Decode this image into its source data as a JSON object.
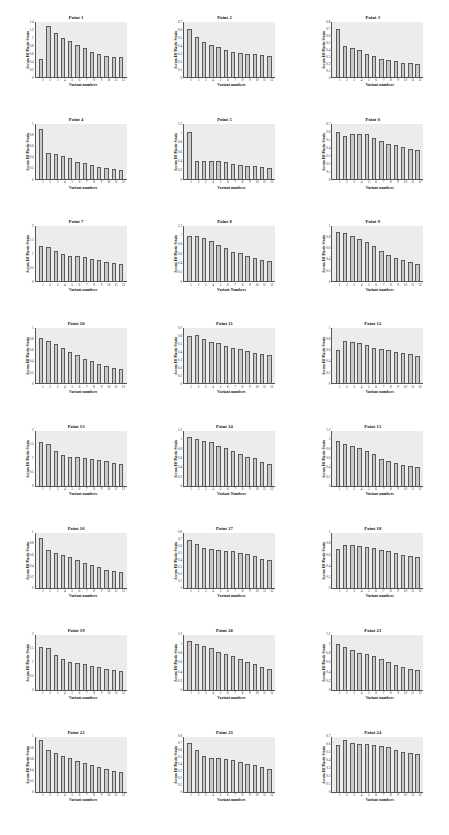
{
  "figure": {
    "layout": {
      "rows": 8,
      "cols": 3,
      "panels": 24
    },
    "shared": {
      "xlabel": "Variant numbers",
      "ylabel": "Accum Eff Plastic Strain",
      "categories": [
        "1",
        "2",
        "3",
        "4",
        "5",
        "6",
        "7",
        "8",
        "9",
        "10",
        "11",
        "12"
      ],
      "bar_fill": "#c9c9c9",
      "bar_edge": "#5a5a5a",
      "plot_background": "#ececec"
    }
  },
  "chart_data": [
    {
      "type": "bar",
      "title": "Point 1",
      "xlabel": "Variant numbers",
      "ylabel": "Accum Eff Plastic Strain",
      "categories": [
        "1",
        "2",
        "3",
        "4",
        "5",
        "6",
        "7",
        "8",
        "9",
        "10",
        "11",
        "12"
      ],
      "values": [
        0.45,
        1.3,
        1.12,
        1.0,
        0.92,
        0.82,
        0.73,
        0.63,
        0.58,
        0.55,
        0.52,
        0.5
      ],
      "ylim": [
        0,
        1.4
      ],
      "yticks": [
        "1.4",
        "1.2",
        "1",
        "0.8",
        "0.6",
        "0.4",
        "0.2",
        "0"
      ]
    },
    {
      "type": "bar",
      "title": "Point 2",
      "xlabel": "Variant numbers",
      "ylabel": "Accum Eff Plastic Strain",
      "categories": [
        "1",
        "2",
        "3",
        "4",
        "5",
        "6",
        "7",
        "8",
        "9",
        "10",
        "11",
        "12"
      ],
      "values": [
        0.61,
        0.51,
        0.45,
        0.41,
        0.38,
        0.35,
        0.32,
        0.31,
        0.3,
        0.29,
        0.285,
        0.27
      ],
      "ylim": [
        0,
        0.7
      ],
      "yticks": [
        "0.7",
        "0.6",
        "0.5",
        "0.4",
        "0.3",
        "0.2",
        "0.1",
        "0"
      ]
    },
    {
      "type": "bar",
      "title": "Point 3",
      "xlabel": "Variant numbers",
      "ylabel": "Accum Eff Plastic Strain",
      "categories": [
        "1",
        "2",
        "3",
        "4",
        "5",
        "6",
        "7",
        "8",
        "9",
        "10",
        "11",
        "12"
      ],
      "values": [
        0.7,
        0.45,
        0.42,
        0.39,
        0.34,
        0.31,
        0.27,
        0.25,
        0.23,
        0.21,
        0.2,
        0.19
      ],
      "ylim": [
        0,
        0.8
      ],
      "yticks": [
        "0.8",
        "0.7",
        "0.6",
        "0.5",
        "0.4",
        "0.3",
        "0.2",
        "0.1",
        "0"
      ]
    },
    {
      "type": "bar",
      "title": "Point 4",
      "xlabel": "Variant numbers",
      "ylabel": "Accum Eff Plastic Strain",
      "categories": [
        "1",
        "2",
        "3",
        "4",
        "5",
        "6",
        "7",
        "8",
        "9",
        "10",
        "11",
        "12"
      ],
      "values": [
        0.92,
        0.47,
        0.45,
        0.42,
        0.38,
        0.32,
        0.29,
        0.26,
        0.22,
        0.21,
        0.18,
        0.17
      ],
      "ylim": [
        0,
        1
      ],
      "yticks": [
        "1",
        "0.8",
        "0.6",
        "0.4",
        "0.2",
        "0"
      ]
    },
    {
      "type": "bar",
      "title": "Point 5",
      "xlabel": "Variant numbers",
      "ylabel": "Accum Eff Plastic Strain",
      "categories": [
        "1",
        "2",
        "3",
        "4",
        "5",
        "6",
        "7",
        "8",
        "9",
        "10",
        "11",
        "12"
      ],
      "values": [
        1.02,
        0.4,
        0.4,
        0.39,
        0.39,
        0.38,
        0.33,
        0.3,
        0.29,
        0.28,
        0.26,
        0.25
      ],
      "ylim": [
        0,
        1.2
      ],
      "yticks": [
        "1.2",
        "1",
        "0.8",
        "0.6",
        "0.4",
        "0.2",
        "0"
      ]
    },
    {
      "type": "bar",
      "title": "Point 6",
      "xlabel": "Variant numbers",
      "ylabel": "Accum Eff Plastic Strain",
      "categories": [
        "1",
        "2",
        "3",
        "4",
        "5",
        "6",
        "7",
        "8",
        "9",
        "10",
        "11",
        "12"
      ],
      "values": [
        0.6,
        0.55,
        0.58,
        0.58,
        0.57,
        0.53,
        0.49,
        0.45,
        0.43,
        0.41,
        0.39,
        0.37
      ],
      "ylim": [
        0,
        0.7
      ],
      "yticks": [
        "0.7",
        "0.6",
        "0.5",
        "0.4",
        "0.3",
        "0.2",
        "0.1",
        "0"
      ]
    },
    {
      "type": "bar",
      "title": "Point 7",
      "xlabel": "Variant numbers",
      "ylabel": "Accum Eff Plastic Strain",
      "categories": [
        "1",
        "2",
        "3",
        "4",
        "5",
        "6",
        "7",
        "8",
        "9",
        "10",
        "11",
        "12"
      ],
      "values": [
        1.27,
        1.26,
        1.12,
        1.0,
        0.93,
        0.92,
        0.9,
        0.83,
        0.78,
        0.71,
        0.68,
        0.62
      ],
      "ylim": [
        0,
        2
      ],
      "yticks": [
        "2",
        "1.5",
        "1",
        "0.5",
        "0"
      ]
    },
    {
      "type": "bar",
      "title": "Point 8",
      "xlabel": "Variant Numbers",
      "ylabel": "Accum Eff Plastic Strain",
      "categories": [
        "1",
        "2",
        "3",
        "4",
        "5",
        "6",
        "7",
        "8",
        "9",
        "10",
        "11",
        "12"
      ],
      "values": [
        1.0,
        0.98,
        0.95,
        0.88,
        0.79,
        0.72,
        0.65,
        0.61,
        0.56,
        0.5,
        0.46,
        0.44
      ],
      "ylim": [
        0,
        1.2
      ],
      "yticks": [
        "1.2",
        "1",
        "0.8",
        "0.6",
        "0.4",
        "0.2",
        "0"
      ]
    },
    {
      "type": "bar",
      "title": "Point 9",
      "xlabel": "Variant numbers",
      "ylabel": "Accum Eff Plastic Strain",
      "categories": [
        "1",
        "2",
        "3",
        "4",
        "5",
        "6",
        "7",
        "8",
        "9",
        "10",
        "11",
        "12"
      ],
      "values": [
        0.9,
        0.88,
        0.83,
        0.77,
        0.71,
        0.64,
        0.55,
        0.48,
        0.43,
        0.38,
        0.35,
        0.31
      ],
      "ylim": [
        0,
        1
      ],
      "yticks": [
        "1",
        "0.8",
        "0.6",
        "0.4",
        "0.2",
        "0"
      ]
    },
    {
      "type": "bar",
      "title": "Point 10",
      "xlabel": "Variant numbers",
      "ylabel": "Accum Eff Plastic Strain",
      "categories": [
        "1",
        "2",
        "3",
        "4",
        "5",
        "6",
        "7",
        "8",
        "9",
        "10",
        "11",
        "12"
      ],
      "values": [
        0.83,
        0.77,
        0.71,
        0.65,
        0.58,
        0.51,
        0.45,
        0.4,
        0.35,
        0.32,
        0.29,
        0.27
      ],
      "ylim": [
        0,
        1
      ],
      "yticks": [
        "1",
        "0.8",
        "0.6",
        "0.4",
        "0.2",
        "0"
      ]
    },
    {
      "type": "bar",
      "title": "Point 11",
      "xlabel": "Variant numbers",
      "ylabel": "Accum Eff Plastic Strain",
      "categories": [
        "1",
        "2",
        "3",
        "4",
        "5",
        "6",
        "7",
        "8",
        "9",
        "10",
        "11",
        "12"
      ],
      "values": [
        0.61,
        0.62,
        0.57,
        0.53,
        0.51,
        0.48,
        0.45,
        0.44,
        0.41,
        0.39,
        0.37,
        0.36
      ],
      "ylim": [
        0,
        0.7
      ],
      "yticks": [
        "0.7",
        "0.6",
        "0.5",
        "0.4",
        "0.3",
        "0.2",
        "0.1",
        "0"
      ]
    },
    {
      "type": "bar",
      "title": "Point 12",
      "xlabel": "Variant numbers",
      "ylabel": "Accum Eff Plastic Strain",
      "categories": [
        "1",
        "2",
        "3",
        "4",
        "5",
        "6",
        "7",
        "8",
        "9",
        "10",
        "11",
        "12"
      ],
      "values": [
        0.6,
        0.78,
        0.76,
        0.73,
        0.7,
        0.65,
        0.62,
        0.6,
        0.58,
        0.55,
        0.53,
        0.5
      ],
      "ylim": [
        0,
        1
      ],
      "yticks": [
        "1",
        "0.8",
        "0.6",
        "0.4",
        "0.2",
        "0"
      ]
    },
    {
      "type": "bar",
      "title": "Point 13",
      "xlabel": "Variant numbers",
      "ylabel": "Accum Eff Plastic Strain",
      "categories": [
        "1",
        "2",
        "3",
        "4",
        "5",
        "6",
        "7",
        "8",
        "9",
        "10",
        "11",
        "12"
      ],
      "values": [
        1.58,
        1.52,
        1.25,
        1.12,
        1.05,
        1.03,
        1.01,
        0.95,
        0.92,
        0.88,
        0.83,
        0.78
      ],
      "ylim": [
        0,
        2
      ],
      "yticks": [
        "2",
        "1.5",
        "1",
        "0.5",
        "0"
      ]
    },
    {
      "type": "bar",
      "title": "Point 14",
      "xlabel": "Variant Numbers",
      "ylabel": "Accum Eff Plastic Strain",
      "categories": [
        "1",
        "2",
        "3",
        "4",
        "5",
        "6",
        "7",
        "8",
        "9",
        "10",
        "11",
        "12"
      ],
      "values": [
        1.05,
        1.02,
        0.98,
        0.95,
        0.87,
        0.82,
        0.76,
        0.68,
        0.63,
        0.6,
        0.51,
        0.48
      ],
      "ylim": [
        0,
        1.2
      ],
      "yticks": [
        "1.2",
        "1",
        "0.8",
        "0.6",
        "0.4",
        "0.2",
        "0"
      ]
    },
    {
      "type": "bar",
      "title": "Point 15",
      "xlabel": "Variant numbers",
      "ylabel": "Accum Eff Plastic Strain",
      "categories": [
        "1",
        "2",
        "3",
        "4",
        "5",
        "6",
        "7",
        "8",
        "9",
        "10",
        "11",
        "12"
      ],
      "values": [
        0.97,
        0.9,
        0.87,
        0.82,
        0.76,
        0.68,
        0.58,
        0.53,
        0.5,
        0.45,
        0.42,
        0.4
      ],
      "ylim": [
        0,
        1.2
      ],
      "yticks": [
        "1.2",
        "1",
        "0.8",
        "0.6",
        "0.4",
        "0.2",
        "0"
      ]
    },
    {
      "type": "bar",
      "title": "Point 16",
      "xlabel": "Variant numbers",
      "ylabel": "Accum Eff Plastic Strain",
      "categories": [
        "1",
        "2",
        "3",
        "4",
        "5",
        "6",
        "7",
        "8",
        "9",
        "10",
        "11",
        "12"
      ],
      "values": [
        0.9,
        0.69,
        0.64,
        0.6,
        0.56,
        0.5,
        0.45,
        0.42,
        0.37,
        0.33,
        0.31,
        0.28
      ],
      "ylim": [
        0,
        1
      ],
      "yticks": [
        "1",
        "0.8",
        "0.6",
        "0.4",
        "0.2",
        "0"
      ]
    },
    {
      "type": "bar",
      "title": "Point 17",
      "xlabel": "Variant numbers",
      "ylabel": "Accum Eff Plastic Strain",
      "categories": [
        "1",
        "2",
        "3",
        "4",
        "5",
        "6",
        "7",
        "8",
        "9",
        "10",
        "11",
        "12"
      ],
      "values": [
        0.7,
        0.63,
        0.58,
        0.57,
        0.55,
        0.54,
        0.53,
        0.51,
        0.49,
        0.46,
        0.42,
        0.41
      ],
      "ylim": [
        0,
        0.8
      ],
      "yticks": [
        "0.8",
        "0.7",
        "0.6",
        "0.5",
        "0.4",
        "0.3",
        "0.2",
        "0.1",
        "0"
      ]
    },
    {
      "type": "bar",
      "title": "Point 18",
      "xlabel": "Variant numbers",
      "ylabel": "Accum Eff Plastic Strain",
      "categories": [
        "1",
        "2",
        "3",
        "4",
        "5",
        "6",
        "7",
        "8",
        "9",
        "10",
        "11",
        "12"
      ],
      "values": [
        0.7,
        0.78,
        0.77,
        0.76,
        0.74,
        0.73,
        0.69,
        0.67,
        0.63,
        0.6,
        0.57,
        0.55
      ],
      "ylim": [
        0,
        1
      ],
      "yticks": [
        "1",
        "0.8",
        "0.6",
        "0.4",
        "0.2",
        "0"
      ]
    },
    {
      "type": "bar",
      "title": "Point 19",
      "xlabel": "Variant numbers",
      "ylabel": "Accum Eff Plastic Strain",
      "categories": [
        "1",
        "2",
        "3",
        "4",
        "5",
        "6",
        "7",
        "8",
        "9",
        "10",
        "11",
        "12"
      ],
      "values": [
        1.57,
        1.52,
        1.28,
        1.13,
        1.03,
        0.99,
        0.93,
        0.88,
        0.82,
        0.77,
        0.72,
        0.68
      ],
      "ylim": [
        0,
        2
      ],
      "yticks": [
        "2",
        "1.5",
        "1",
        "0.5",
        "0"
      ]
    },
    {
      "type": "bar",
      "title": "Point 20",
      "xlabel": "Variant numbers",
      "ylabel": "Accum Eff Plastic Strain",
      "categories": [
        "1",
        "2",
        "3",
        "4",
        "5",
        "6",
        "7",
        "8",
        "9",
        "10",
        "11",
        "12"
      ],
      "values": [
        1.06,
        1.01,
        0.96,
        0.91,
        0.83,
        0.78,
        0.73,
        0.67,
        0.61,
        0.56,
        0.5,
        0.46
      ],
      "ylim": [
        0,
        1.2
      ],
      "yticks": [
        "1.2",
        "1",
        "0.8",
        "0.6",
        "0.4",
        "0.2",
        "0"
      ]
    },
    {
      "type": "bar",
      "title": "Point 21",
      "xlabel": "Variant numbers",
      "ylabel": "Accum Eff Plastic Strain",
      "categories": [
        "1",
        "2",
        "3",
        "4",
        "5",
        "6",
        "7",
        "8",
        "9",
        "10",
        "11",
        "12"
      ],
      "values": [
        1.01,
        0.93,
        0.88,
        0.81,
        0.78,
        0.73,
        0.68,
        0.6,
        0.55,
        0.49,
        0.45,
        0.43
      ],
      "ylim": [
        0,
        1.2
      ],
      "yticks": [
        "1.2",
        "1",
        "0.8",
        "0.6",
        "0.4",
        "0.2",
        "0"
      ]
    },
    {
      "type": "bar",
      "title": "Point 22",
      "xlabel": "Variant numbers",
      "ylabel": "Accum Eff Plastic Strain",
      "categories": [
        "1",
        "2",
        "3",
        "4",
        "5",
        "6",
        "7",
        "8",
        "9",
        "10",
        "11",
        "12"
      ],
      "values": [
        0.94,
        0.76,
        0.7,
        0.65,
        0.61,
        0.57,
        0.52,
        0.49,
        0.45,
        0.41,
        0.39,
        0.36
      ],
      "ylim": [
        0,
        1
      ],
      "yticks": [
        "1",
        "0.8",
        "0.6",
        "0.4",
        "0.2",
        "0"
      ]
    },
    {
      "type": "bar",
      "title": "Point 23",
      "xlabel": "Variant numbers",
      "ylabel": "Accum Eff Plastic Strain",
      "categories": [
        "1",
        "2",
        "3",
        "4",
        "5",
        "6",
        "7",
        "8",
        "9",
        "10",
        "11",
        "12"
      ],
      "values": [
        0.71,
        0.61,
        0.52,
        0.5,
        0.5,
        0.48,
        0.47,
        0.44,
        0.41,
        0.39,
        0.37,
        0.34
      ],
      "ylim": [
        0,
        0.8
      ],
      "yticks": [
        "0.8",
        "0.7",
        "0.6",
        "0.5",
        "0.4",
        "0.3",
        "0.2",
        "0.1",
        "0"
      ]
    },
    {
      "type": "bar",
      "title": "Point 24",
      "xlabel": "Variant numbers",
      "ylabel": "Accum Eff Plastic Strain",
      "categories": [
        "1",
        "2",
        "3",
        "4",
        "5",
        "6",
        "7",
        "8",
        "9",
        "10",
        "11",
        "12"
      ],
      "values": [
        0.6,
        0.66,
        0.62,
        0.61,
        0.61,
        0.6,
        0.58,
        0.57,
        0.54,
        0.51,
        0.5,
        0.48
      ],
      "ylim": [
        0,
        0.7
      ],
      "yticks": [
        "0.7",
        "0.6",
        "0.5",
        "0.4",
        "0.3",
        "0.2",
        "0.1",
        "0"
      ]
    }
  ]
}
